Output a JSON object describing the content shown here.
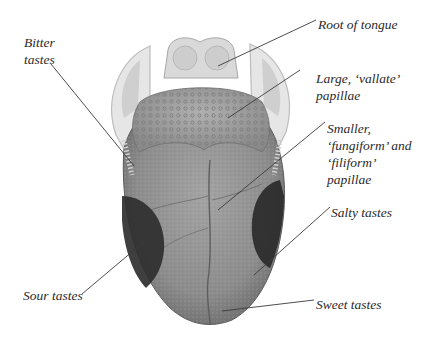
{
  "diagram": {
    "labels": {
      "root": "Root of tongue",
      "vallate_1": "Large, ‘vallate’",
      "vallate_2": "papillae",
      "fungi_1": "Smaller,",
      "fungi_2": "‘fungiform’ and",
      "fungi_3": "‘filiform’",
      "fungi_4": "papillae",
      "salty": "Salty tastes",
      "sweet": "Sweet tastes",
      "bitter_1": "Bitter",
      "bitter_2": "tastes",
      "sour": "Sour tastes"
    },
    "colors": {
      "leader_line": "#3a3a3a",
      "tongue_body": "#8a8a8a",
      "taste_patch": "#2e2e2e",
      "papillae_region": "#9c9c9c",
      "epiglottis": "#d9d9d9"
    }
  }
}
